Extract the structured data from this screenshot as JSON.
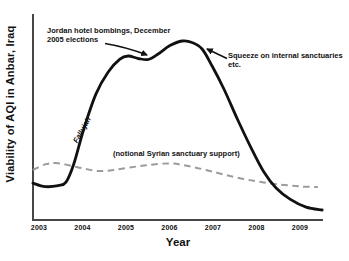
{
  "figure": {
    "ylabel": "Viability of AQI in Anbar, Iraq",
    "xlabel": "Year",
    "annotations": {
      "jordan_line1": "Jordan hotel bombings, December",
      "jordan_line2": "2005 elections",
      "squeeze_line1": "Squeeze on internal sanctuaries",
      "squeeze_line2": "etc.",
      "fallujah": "Fallujah",
      "syrian": "(notional Syrian sanctuary support)"
    },
    "colors": {
      "aqi_line": "#111111",
      "syrian_line": "#9b9b9b",
      "axis": "#474747",
      "text": "#111111",
      "background": "#ffffff"
    }
  },
  "chart_data": {
    "type": "line",
    "title": "",
    "xlabel": "Year",
    "ylabel": "Viability of AQI in Anbar, Iraq",
    "x_ticks": [
      "2003",
      "2004",
      "2005",
      "2006",
      "2007",
      "2008",
      "2009"
    ],
    "x_range": [
      2002.85,
      2009.55
    ],
    "y_range": [
      0,
      100
    ],
    "grid": false,
    "legend": "none",
    "series": [
      {
        "name": "AQI viability",
        "style": "solid",
        "color": "#111111",
        "x": [
          2002.86,
          2003.14,
          2003.44,
          2003.62,
          2003.8,
          2004.03,
          2004.31,
          2004.59,
          2004.86,
          2005.05,
          2005.28,
          2005.51,
          2005.74,
          2006.01,
          2006.29,
          2006.52,
          2006.75,
          2006.98,
          2007.25,
          2007.57,
          2007.9,
          2008.17,
          2008.45,
          2008.77,
          2009.14,
          2009.51
        ],
        "y": [
          18.0,
          16.3,
          16.8,
          18.5,
          27.3,
          44.4,
          61.5,
          72.2,
          78.5,
          80.0,
          78.8,
          78.3,
          81.0,
          85.1,
          87.3,
          86.6,
          83.4,
          75.1,
          63.9,
          48.8,
          34.1,
          23.4,
          15.6,
          10.2,
          6.3,
          4.9
        ]
      },
      {
        "name": "(notional Syrian sanctuary support)",
        "style": "dashed",
        "color": "#9b9b9b",
        "x": [
          2002.86,
          2003.14,
          2003.39,
          2003.71,
          2004.03,
          2004.36,
          2004.72,
          2005.09,
          2005.51,
          2006.01,
          2006.43,
          2006.84,
          2007.25,
          2007.71,
          2008.17,
          2008.63,
          2009.05,
          2009.41
        ],
        "y": [
          24.4,
          27.1,
          27.8,
          26.6,
          25.1,
          23.9,
          24.4,
          25.6,
          26.8,
          27.6,
          26.3,
          24.4,
          22.2,
          20.0,
          18.3,
          17.1,
          16.3,
          16.1
        ]
      }
    ]
  }
}
